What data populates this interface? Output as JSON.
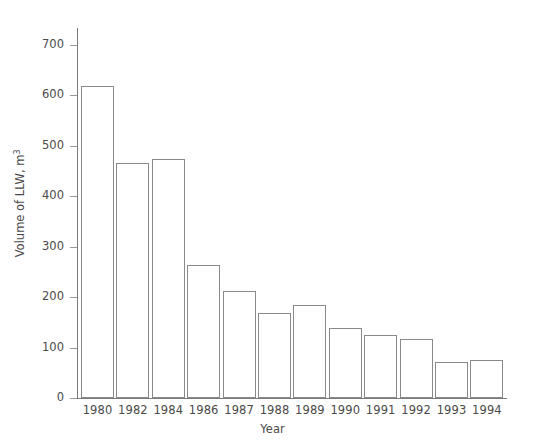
{
  "chart_data": {
    "type": "bar",
    "title": "",
    "xlabel": "Year",
    "ylabel": "Volume of LLW, m",
    "ylabel_superscript": "3",
    "categories": [
      "1980",
      "1982",
      "1984",
      "1986",
      "1987",
      "1988",
      "1989",
      "1990",
      "1991",
      "1992",
      "1993",
      "1994"
    ],
    "values": [
      618,
      466,
      474,
      263,
      212,
      169,
      185,
      139,
      124,
      117,
      72,
      76
    ],
    "ylim": [
      0,
      730
    ],
    "y_ticks": [
      0,
      100,
      200,
      300,
      400,
      500,
      600,
      700
    ],
    "y_tick_labels": [
      "0",
      "100",
      "200",
      "300",
      "400",
      "500",
      "600",
      "700"
    ],
    "grid": false,
    "legend": null,
    "bar_style": {
      "fill": "#ffffff",
      "edge_color": "#8a8a8a"
    },
    "axis_color": "#7a7a7a",
    "text_color": "#4a4a4a",
    "background": "#ffffff"
  }
}
